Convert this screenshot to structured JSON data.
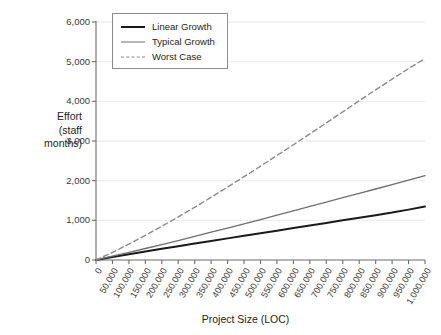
{
  "chart_data": {
    "type": "line",
    "title": "",
    "xlabel": "Project Size (LOC)",
    "ylabel": "Effort (staff months)",
    "ylabel_lines": [
      "Effort",
      "(staff",
      "months)"
    ],
    "xlim": [
      0,
      1000000
    ],
    "ylim": [
      0,
      6000
    ],
    "grid": true,
    "legend_position": "top-left-inside",
    "x_tick_labels": [
      "0",
      "50,000",
      "100,000",
      "150,000",
      "200,000",
      "250,000",
      "300,000",
      "350,000",
      "400,000",
      "450,000",
      "500,000",
      "550,000",
      "600,000",
      "650,000",
      "700,000",
      "750,000",
      "800,000",
      "850,000",
      "900,000",
      "950,000",
      "1,000,000"
    ],
    "y_tick_labels": [
      "0",
      "1,000",
      "2,000",
      "3,000",
      "4,000",
      "5,000",
      "6,000"
    ],
    "y_tick_values": [
      0,
      1000,
      2000,
      3000,
      4000,
      5000,
      6000
    ],
    "x": [
      0,
      50000,
      100000,
      150000,
      200000,
      250000,
      300000,
      350000,
      400000,
      450000,
      500000,
      550000,
      600000,
      650000,
      700000,
      750000,
      800000,
      850000,
      900000,
      950000,
      1000000
    ],
    "series": [
      {
        "name": "Linear Growth",
        "color": "#1a1a1a",
        "style": "solid",
        "width": 2.0,
        "values": [
          0,
          75,
          145,
          215,
          282,
          348,
          415,
          480,
          545,
          610,
          675,
          740,
          805,
          870,
          935,
          1000,
          1065,
          1130,
          1195,
          1270,
          1350
        ]
      },
      {
        "name": "Typical Growth",
        "color": "#6e6e6e",
        "style": "solid",
        "width": 1.3,
        "values": [
          0,
          95,
          190,
          290,
          390,
          490,
          595,
          700,
          805,
          910,
          1020,
          1130,
          1240,
          1350,
          1460,
          1570,
          1680,
          1790,
          1900,
          2015,
          2130
        ]
      },
      {
        "name": "Worst Case",
        "color": "#8a8a8a",
        "style": "dashed",
        "width": 1.4,
        "values": [
          0,
          190,
          400,
          620,
          850,
          1085,
          1330,
          1580,
          1840,
          2100,
          2365,
          2635,
          2905,
          3180,
          3455,
          3735,
          4015,
          4290,
          4560,
          4825,
          5080
        ]
      }
    ],
    "colors": {
      "axis": "#6d6d6d",
      "gridline": "#eceef0",
      "text": "#231f20",
      "legend_border": "#8d8d8d",
      "background": "#ffffff"
    }
  }
}
